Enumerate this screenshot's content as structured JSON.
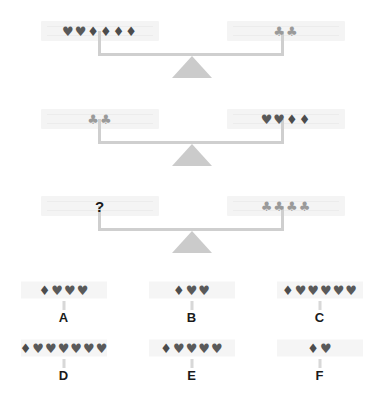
{
  "puzzle": {
    "question_mark": "?",
    "symbol_glyphs": {
      "heart": "♥",
      "diamond": "♦",
      "club": "♣"
    },
    "colors": {
      "heart": "#595959",
      "diamond": "#4c4c4c",
      "club": "#9a9a9a",
      "beam": "#cfcfcf",
      "fulcrum": "#cbcbcb",
      "slab": "#f4f4f4",
      "label": "#1a1a1a"
    },
    "scales": [
      {
        "name": "scale-1",
        "left": {
          "symbols": [
            "heart",
            "heart",
            "diamond",
            "diamond",
            "diamond",
            "diamond"
          ]
        },
        "right": {
          "symbols": [
            "club",
            "club"
          ]
        }
      },
      {
        "name": "scale-2",
        "left": {
          "symbols": [
            "club",
            "club"
          ]
        },
        "right": {
          "symbols": [
            "heart",
            "heart",
            "diamond",
            "diamond"
          ]
        }
      },
      {
        "name": "scale-3",
        "left": {
          "symbols": [],
          "unknown": true
        },
        "right": {
          "symbols": [
            "club",
            "club",
            "club",
            "club"
          ]
        }
      }
    ],
    "options": [
      {
        "label": "A",
        "symbols": [
          "diamond",
          "heart",
          "heart",
          "heart"
        ]
      },
      {
        "label": "B",
        "symbols": [
          "diamond",
          "heart",
          "heart"
        ]
      },
      {
        "label": "C",
        "symbols": [
          "diamond",
          "heart",
          "heart",
          "heart",
          "heart",
          "heart"
        ]
      },
      {
        "label": "D",
        "symbols": [
          "diamond",
          "heart",
          "heart",
          "heart",
          "heart",
          "heart",
          "heart"
        ]
      },
      {
        "label": "E",
        "symbols": [
          "diamond",
          "heart",
          "heart",
          "heart",
          "heart"
        ]
      },
      {
        "label": "F",
        "symbols": [
          "diamond",
          "heart"
        ]
      }
    ]
  }
}
